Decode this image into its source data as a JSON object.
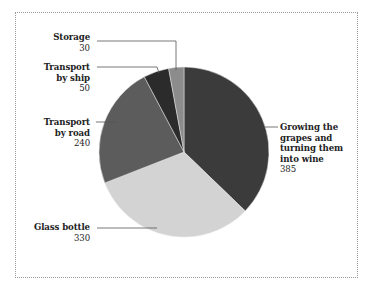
{
  "chart_data": {
    "type": "pie",
    "title": "",
    "categories": [
      "Growing the grapes and turning them into wine",
      "Glass bottle",
      "Transport by road",
      "Transport by ship",
      "Storage"
    ],
    "values": [
      385,
      330,
      240,
      50,
      30
    ],
    "colors": [
      "#3b3b3b",
      "#d3d3d3",
      "#5c5c5c",
      "#2b2b2b",
      "#8c8c8c"
    ],
    "start_angle_deg": 0,
    "direction": "clockwise",
    "labels": [
      {
        "name_lines": [
          "Growing the",
          "grapes and",
          "turning them",
          "into wine"
        ],
        "value": "385"
      },
      {
        "name_lines": [
          "Glass bottle"
        ],
        "value": "330"
      },
      {
        "name_lines": [
          "Transport",
          "by road"
        ],
        "value": "240"
      },
      {
        "name_lines": [
          "Transport",
          "by ship"
        ],
        "value": "50"
      },
      {
        "name_lines": [
          "Storage"
        ],
        "value": "30"
      }
    ]
  }
}
